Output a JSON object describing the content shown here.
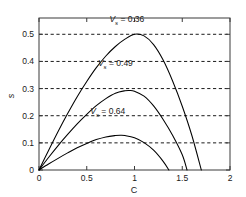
{
  "chart_data": {
    "type": "line",
    "title": "",
    "xlabel": "C",
    "ylabel": "s",
    "xlim": [
      0,
      2
    ],
    "ylim": [
      0,
      0.56
    ],
    "grid": "horizontal-dashed",
    "legend_position": "inline-annotations",
    "xticks": [
      "0",
      "0.5",
      "1",
      "1.5",
      "2"
    ],
    "xtick_values": [
      0,
      0.5,
      1,
      1.5,
      2
    ],
    "yticks": [
      "0",
      "0.1",
      "0.2",
      "0.3",
      "0.4",
      "0.5"
    ],
    "ytick_values": [
      0,
      0.1,
      0.2,
      0.3,
      0.4,
      0.5
    ],
    "gridlines_y": [
      0.1,
      0.2,
      0.3,
      0.4,
      0.5
    ],
    "series": [
      {
        "name": "Vs = 0.36",
        "label_prefix": "V",
        "label_subscript": "s",
        "label_suffix": " = 0.36",
        "vs_value": 0.36,
        "color": "#000000",
        "peak_x": 1.0,
        "peak_y": 0.5,
        "zero_crossing_x": 1.7,
        "x": [
          0,
          0.1,
          0.2,
          0.3,
          0.4,
          0.5,
          0.6,
          0.7,
          0.8,
          0.9,
          1.0,
          1.1,
          1.2,
          1.3,
          1.4,
          1.5,
          1.6,
          1.7
        ],
        "values": [
          0,
          0.072,
          0.142,
          0.208,
          0.27,
          0.326,
          0.377,
          0.42,
          0.455,
          0.482,
          0.5,
          0.494,
          0.462,
          0.405,
          0.327,
          0.235,
          0.128,
          0.0
        ]
      },
      {
        "name": "Vs = 0.49",
        "label_prefix": "V",
        "label_subscript": "s",
        "label_suffix": " = 0.49",
        "vs_value": 0.49,
        "color": "#000000",
        "peak_x": 0.95,
        "peak_y": 0.293,
        "zero_crossing_x": 1.55,
        "x": [
          0,
          0.1,
          0.2,
          0.3,
          0.4,
          0.5,
          0.6,
          0.7,
          0.8,
          0.9,
          0.95,
          1.0,
          1.1,
          1.2,
          1.3,
          1.4,
          1.5,
          1.55
        ],
        "values": [
          0,
          0.046,
          0.09,
          0.131,
          0.17,
          0.205,
          0.237,
          0.263,
          0.283,
          0.292,
          0.293,
          0.29,
          0.272,
          0.236,
          0.186,
          0.127,
          0.056,
          0.0
        ]
      },
      {
        "name": "Vs = 0.64",
        "label_prefix": "V",
        "label_subscript": "s",
        "label_suffix": " = 0.64",
        "vs_value": 0.64,
        "color": "#000000",
        "peak_x": 0.85,
        "peak_y": 0.128,
        "zero_crossing_x": 1.36,
        "x": [
          0,
          0.1,
          0.2,
          0.3,
          0.4,
          0.5,
          0.6,
          0.7,
          0.8,
          0.85,
          0.9,
          1.0,
          1.1,
          1.2,
          1.3,
          1.36
        ],
        "values": [
          0,
          0.022,
          0.043,
          0.063,
          0.082,
          0.098,
          0.112,
          0.122,
          0.127,
          0.128,
          0.127,
          0.119,
          0.101,
          0.073,
          0.032,
          0.0
        ]
      }
    ],
    "annotations": [
      {
        "text": "V",
        "sub": "s",
        "rest": " = 0.36",
        "x": 0.92,
        "y": 0.545
      },
      {
        "text": "V",
        "sub": "s",
        "rest": " = 0.49",
        "x": 0.8,
        "y": 0.385
      },
      {
        "text": "V",
        "sub": "s",
        "rest": " = 0.64",
        "x": 0.72,
        "y": 0.205
      }
    ]
  },
  "axes": {
    "x_title": "C",
    "y_title": "s"
  },
  "colors": {
    "curve": "#000000",
    "grid": "#000000",
    "axis": "#000000",
    "background": "#ffffff"
  }
}
